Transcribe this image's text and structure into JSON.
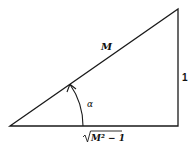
{
  "diagram": {
    "type": "right-triangle",
    "hypotenuse_label": "M",
    "opposite_label": "1",
    "adjacent_label_radicand": "M² − 1",
    "angle_label": "α",
    "stroke_color": "#1a1a1a"
  }
}
